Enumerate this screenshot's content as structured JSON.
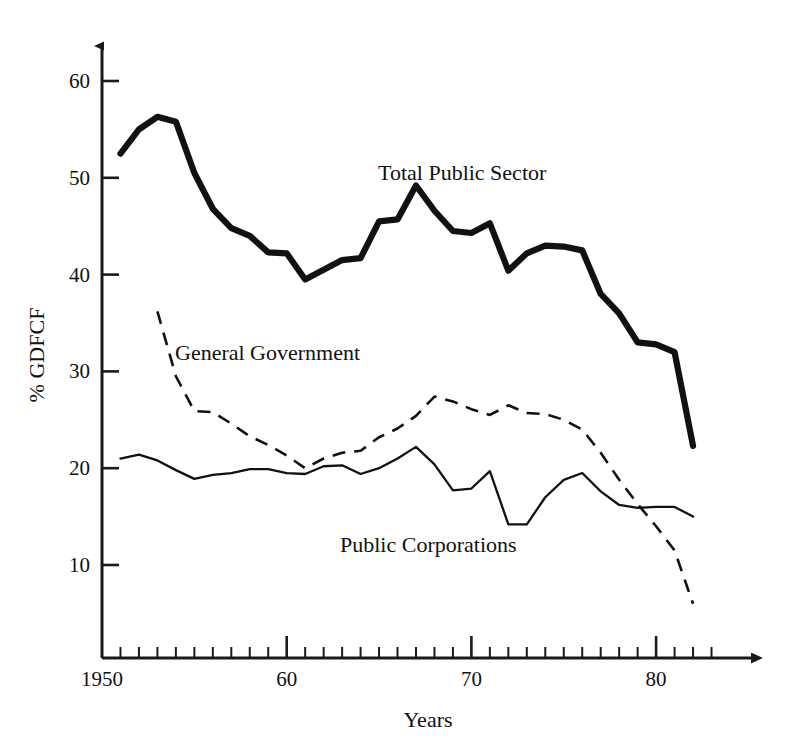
{
  "chart_data": {
    "type": "line",
    "title": "",
    "xlabel": "Years",
    "ylabel": "% GDFCF",
    "xlim": [
      1950,
      1984
    ],
    "ylim": [
      0,
      64
    ],
    "grid": false,
    "legend_position": "inline-annotations",
    "x_tick_labels": [
      "1950",
      "60",
      "70",
      "80"
    ],
    "x_tick_values": [
      1950,
      1960,
      1970,
      1980
    ],
    "x_minor_step": 1,
    "y_tick_labels": [
      "10",
      "20",
      "30",
      "40",
      "50",
      "60"
    ],
    "y_tick_values": [
      10,
      20,
      30,
      40,
      50,
      60
    ],
    "series": [
      {
        "name": "Total Public Sector",
        "style": "thick-solid",
        "color": "#111111",
        "x": [
          1951,
          1952,
          1953,
          1954,
          1955,
          1956,
          1957,
          1958,
          1959,
          1960,
          1961,
          1962,
          1963,
          1964,
          1965,
          1966,
          1967,
          1968,
          1969,
          1970,
          1971,
          1972,
          1973,
          1974,
          1975,
          1976,
          1977,
          1978,
          1979,
          1980,
          1981,
          1982
        ],
        "values": [
          52.5,
          55.0,
          56.3,
          55.8,
          50.5,
          46.8,
          44.8,
          44.0,
          42.3,
          42.2,
          39.5,
          40.5,
          41.5,
          41.7,
          45.5,
          45.7,
          49.2,
          46.6,
          44.5,
          44.3,
          45.3,
          40.4,
          42.2,
          43.0,
          42.9,
          42.5,
          38.0,
          36.0,
          33.0,
          32.8,
          32.0,
          22.3
        ]
      },
      {
        "name": "General Government",
        "style": "dashed",
        "color": "#111111",
        "x": [
          1953,
          1954,
          1955,
          1956,
          1957,
          1958,
          1959,
          1960,
          1961,
          1962,
          1963,
          1964,
          1965,
          1966,
          1967,
          1968,
          1969,
          1970,
          1971,
          1972,
          1973,
          1974,
          1975,
          1976,
          1977,
          1978,
          1979,
          1980,
          1981,
          1982
        ],
        "values": [
          36.2,
          29.5,
          25.9,
          25.8,
          24.6,
          23.3,
          22.4,
          21.3,
          20.0,
          21.0,
          21.6,
          21.8,
          23.2,
          24.1,
          25.4,
          27.4,
          26.9,
          26.1,
          25.5,
          26.5,
          25.7,
          25.6,
          25.0,
          24.0,
          21.6,
          18.8,
          16.3,
          14.0,
          11.5,
          6.0
        ]
      },
      {
        "name": "Public Corporations",
        "style": "thin-solid",
        "color": "#111111",
        "x": [
          1951,
          1952,
          1953,
          1954,
          1955,
          1956,
          1957,
          1958,
          1959,
          1960,
          1961,
          1962,
          1963,
          1964,
          1965,
          1966,
          1967,
          1968,
          1969,
          1970,
          1971,
          1972,
          1973,
          1974,
          1975,
          1976,
          1977,
          1978,
          1979,
          1980,
          1981,
          1982
        ],
        "values": [
          21.0,
          21.4,
          20.8,
          19.8,
          18.9,
          19.3,
          19.5,
          19.9,
          19.9,
          19.5,
          19.4,
          20.2,
          20.3,
          19.4,
          20.0,
          21.0,
          22.2,
          20.4,
          17.7,
          17.9,
          19.7,
          14.2,
          14.2,
          17.0,
          18.8,
          19.5,
          17.6,
          16.2,
          15.9,
          16.0,
          16.0,
          15.0
        ]
      }
    ],
    "annotations": [
      {
        "text": "Total Public Sector",
        "x_px": 378,
        "y_px": 180
      },
      {
        "text": "General Government",
        "x_px": 175,
        "y_px": 360
      },
      {
        "text": "Public Corporations",
        "x_px": 340,
        "y_px": 552
      }
    ]
  },
  "axes": {
    "y_title": "% GDFCF",
    "x_title": "Years"
  }
}
